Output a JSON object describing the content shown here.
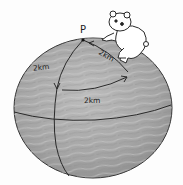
{
  "illustration": {
    "subject": "sphere with bear on top",
    "point_label": "P",
    "labels": {
      "left_meridian": "2km",
      "right_meridian": "2km",
      "arc": "2km"
    },
    "colors": {
      "sphere_fill": "#a8a8a8",
      "sphere_shade": "#8c8c8c",
      "line": "#2a2a2a",
      "bear_fill": "#ffffff"
    }
  }
}
